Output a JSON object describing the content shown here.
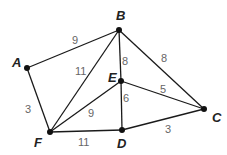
{
  "graph": {
    "nodes": [
      {
        "id": "A",
        "x": 27,
        "y": 68,
        "lx": 12,
        "ly": 67
      },
      {
        "id": "B",
        "x": 119,
        "y": 30,
        "lx": 116,
        "ly": 20
      },
      {
        "id": "C",
        "x": 204,
        "y": 109,
        "lx": 212,
        "ly": 122
      },
      {
        "id": "D",
        "x": 122,
        "y": 130,
        "lx": 117,
        "ly": 148
      },
      {
        "id": "E",
        "x": 121,
        "y": 81,
        "lx": 108,
        "ly": 82
      },
      {
        "id": "F",
        "x": 50,
        "y": 132,
        "lx": 34,
        "ly": 147
      }
    ],
    "edges": [
      {
        "from": "A",
        "to": "B",
        "weight": "9",
        "wx": 72,
        "wy": 44
      },
      {
        "from": "A",
        "to": "F",
        "weight": "3",
        "wx": 25,
        "wy": 113
      },
      {
        "from": "B",
        "to": "F",
        "weight": "11",
        "wx": 75,
        "wy": 75
      },
      {
        "from": "B",
        "to": "E",
        "weight": "8",
        "wx": 122,
        "wy": 65
      },
      {
        "from": "B",
        "to": "C",
        "weight": "8",
        "wx": 161,
        "wy": 62
      },
      {
        "from": "E",
        "to": "C",
        "weight": "5",
        "wx": 160,
        "wy": 93
      },
      {
        "from": "E",
        "to": "D",
        "weight": "6",
        "wx": 123,
        "wy": 102
      },
      {
        "from": "E",
        "to": "F",
        "weight": "9",
        "wx": 88,
        "wy": 117
      },
      {
        "from": "F",
        "to": "D",
        "weight": "11",
        "wx": 78,
        "wy": 146
      },
      {
        "from": "D",
        "to": "C",
        "weight": "3",
        "wx": 165,
        "wy": 133
      }
    ]
  }
}
